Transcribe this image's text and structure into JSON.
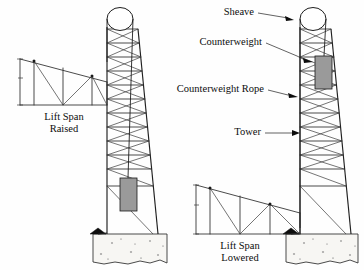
{
  "figure": {
    "background_color": "#fefefe",
    "line_color": "#2a2a2a",
    "counterweight_color": "#9a9a9a",
    "foundation_color": "#f7f6f3"
  },
  "callouts": [
    {
      "id": "sheave",
      "label": "Sheave"
    },
    {
      "id": "counterweight",
      "label": "Counterweight"
    },
    {
      "id": "counterweight-rope",
      "label": "Counterweight Rope"
    },
    {
      "id": "tower",
      "label": "Tower"
    }
  ],
  "captions": {
    "left": {
      "line1": "Lift Span",
      "line2": "Raised"
    },
    "right": {
      "line1": "Lift Span",
      "line2": "Lowered"
    }
  },
  "assemblies": {
    "left": {
      "name": "left-assembly",
      "state": "raised",
      "counterweight_position": "low",
      "lift_span_position": "high"
    },
    "right": {
      "name": "right-assembly",
      "state": "lowered",
      "counterweight_position": "high",
      "lift_span_position": "low"
    }
  }
}
